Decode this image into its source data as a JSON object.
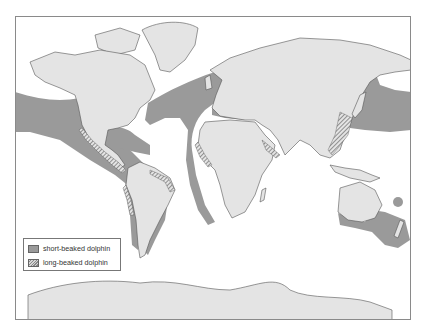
{
  "map": {
    "title": "",
    "colors": {
      "land": "#e4e4e4",
      "ocean": "#ffffff",
      "short_beaked_range": "#9a9a9a",
      "long_beaked_hatch": "#6a6a6a",
      "border": "#555555",
      "frame": "#8a8a8a"
    },
    "regions_shown": [
      "North America",
      "South America",
      "Europe",
      "Africa",
      "Asia",
      "Australia",
      "Antarctica",
      "Greenland"
    ],
    "ranges": {
      "short_beaked": [
        "North Pacific band",
        "North Atlantic band",
        "Eastern Pacific off Central/South America",
        "Gulf of Mexico and Caribbean",
        "West coast of Africa",
        "Mediterranean Sea",
        "Black Sea",
        "Sea of Japan / NW Pacific",
        "Southern Australia and New Zealand",
        "Western South Atlantic (Argentina)"
      ],
      "long_beaked": [
        "Pacific coast of Mexico and Central America",
        "Peru coast",
        "Brazil/Venezuela coast",
        "West Africa coast",
        "Red Sea / Arabian Sea",
        "China/Korea/Japan coast"
      ]
    }
  },
  "legend": {
    "items": [
      {
        "label": "short-beaked dolphin",
        "pattern": "solid"
      },
      {
        "label": "long-beaked dolphin",
        "pattern": "hatched"
      }
    ]
  }
}
